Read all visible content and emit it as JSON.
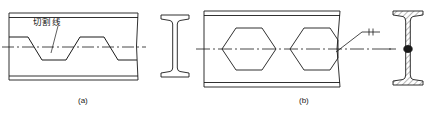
{
  "figure": {
    "title": "",
    "captions": {
      "left": "(a)",
      "right": "(b)"
    },
    "annotations": {
      "cutting_line": "切割线",
      "cutting_line_meaning": "cutting line"
    }
  },
  "panel_a": {
    "name": "I-beam web with zigzag cutting line",
    "caption": "(a)",
    "label": "切割线",
    "beam": {
      "x": 8,
      "y": 13,
      "width": 130,
      "height": 67
    },
    "elements": [
      "top-flange-double-line",
      "bottom-flange-double-line",
      "zigzag-cut-path",
      "horizontal-centerline-dashdot",
      "leader-line-to-cut"
    ],
    "cut_path_points": "zigzag trapezoidal castellation profile across web",
    "cross_section": {
      "name": "rolled I-beam section",
      "x": 160,
      "y": 14,
      "width": 30,
      "height": 64,
      "flanges": "tapered",
      "hatched": false
    }
  },
  "panel_b": {
    "name": "Castellated beam with hexagonal web openings",
    "caption": "(b)",
    "beam": {
      "x": 203,
      "y": 11,
      "width": 137,
      "height": 76
    },
    "elements": [
      "top-flange-double-line",
      "bottom-flange-double-line",
      "hexagon-opening-1",
      "hexagon-opening-2",
      "horizontal-centerline-dashdot",
      "weld-symbol-leader",
      "break-line-right-edge"
    ],
    "openings": {
      "count": 2,
      "shape": "hexagon"
    },
    "weld_symbol": {
      "name": "fillet-weld-leader",
      "ticks": 2
    },
    "cross_section": {
      "name": "welded castellated I-beam section",
      "x": 392,
      "y": 10,
      "width": 32,
      "height": 76,
      "flanges": "tapered",
      "hatched": true,
      "weld_node": "mid-web weld joint"
    }
  },
  "colors": {
    "line": "#1a1a1a",
    "background": "#ffffff",
    "hatch": "#333333"
  }
}
